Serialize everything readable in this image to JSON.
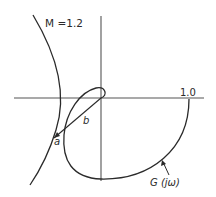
{
  "diagram": {
    "labels": {
      "m_circle": "M =1.2",
      "real_tick": "1.0",
      "point_a": "a",
      "point_b": "b",
      "curve": "G (jω)"
    },
    "colors": {
      "stroke": "#2a2a2a",
      "background": "#ffffff"
    }
  }
}
